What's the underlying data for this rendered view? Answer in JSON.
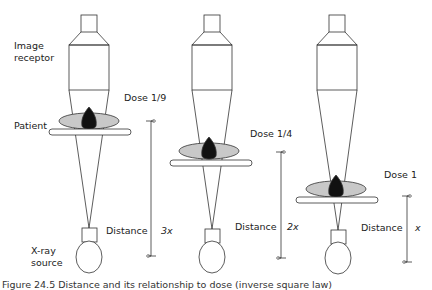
{
  "labels": {
    "image_receptor": [
      "Image",
      "receptor"
    ],
    "patient": "Patient",
    "xray_source": [
      "X-ray",
      "source"
    ]
  },
  "setups": [
    {
      "dose": "Dose 1/9",
      "distance_label": "Distance",
      "distance_value": "3x"
    },
    {
      "dose": "Dose 1/4",
      "distance_label": "Distance",
      "distance_value": "2x"
    },
    {
      "dose": "Dose 1",
      "distance_label": "Distance",
      "distance_value": "x"
    }
  ],
  "caption": "Figure 24.5  Distance and its relationship to dose (inverse square law)",
  "colors": {
    "line": "#333333",
    "patient_fill": "#c8c8c8",
    "organ_fill": "#111111"
  }
}
